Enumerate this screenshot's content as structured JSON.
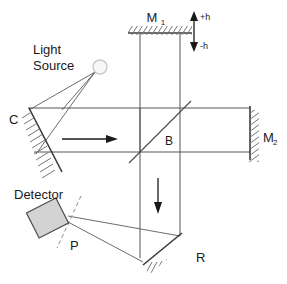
{
  "diagram": {
    "background_color": "#ffffff",
    "line_color": "#555555",
    "label_color": "#1a1a1a",
    "detector_fill": "#d3d3d3",
    "hatch_color": "#767676",
    "labels": {
      "mirror_m1": "M",
      "mirror_m1_sub": "1",
      "mirror_m2": "M",
      "mirror_m2_sub": "2",
      "displacement_positive": "+h",
      "displacement_negative": "-h",
      "light_source_line1": "Light",
      "light_source_line2": "Source",
      "collimator": "C",
      "beam_splitter": "B",
      "detector": "Detector",
      "polarizer": "P",
      "retro_mirror": "R"
    },
    "components": [
      {
        "id": "light-source",
        "name": "Light Source",
        "type": "source",
        "shape": "circle"
      },
      {
        "id": "mirror-c",
        "name": "C",
        "type": "curved-mirror",
        "shape": "concave-arc"
      },
      {
        "id": "mirror-m1",
        "name": "M1",
        "type": "flat-mirror",
        "shape": "horizontal-bar"
      },
      {
        "id": "mirror-m2",
        "name": "M2",
        "type": "flat-mirror",
        "shape": "vertical-bar"
      },
      {
        "id": "beam-splitter",
        "name": "B",
        "type": "beam-splitter",
        "shape": "diagonal-line"
      },
      {
        "id": "mirror-r",
        "name": "R",
        "type": "flat-mirror",
        "shape": "diagonal-bar"
      },
      {
        "id": "detector",
        "name": "Detector",
        "type": "detector",
        "shape": "rotated-rectangle"
      },
      {
        "id": "polarizer-p",
        "name": "P",
        "type": "polarizer",
        "shape": "dashed-line"
      }
    ],
    "direction_arrows": [
      {
        "id": "beam-arrow-right",
        "direction": "right",
        "meaning": "beam travels toward beam splitter"
      },
      {
        "id": "beam-arrow-down",
        "direction": "down",
        "meaning": "beam travels toward retro mirror R"
      },
      {
        "id": "m1-displacement",
        "direction": "vertical-double",
        "meaning": "M1 displacement +h / -h"
      }
    ]
  }
}
